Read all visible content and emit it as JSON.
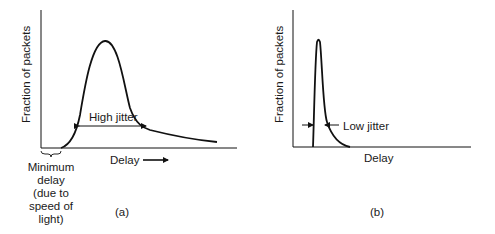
{
  "panel_a": {
    "ylabel": "Fraction of packets",
    "xlabel": "Delay",
    "annotation": "High jitter",
    "min_delay_lines": [
      "Minimum",
      "delay",
      "(due to",
      "speed of",
      "light)"
    ],
    "caption": "(a)"
  },
  "panel_b": {
    "ylabel": "Fraction of packets",
    "xlabel": "Delay",
    "annotation": "Low jitter",
    "caption": "(b)"
  },
  "colors": {
    "stroke": "#111111",
    "text": "#1a1a1a",
    "background": "#ffffff"
  }
}
